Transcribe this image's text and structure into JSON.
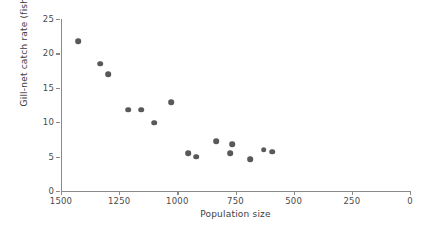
{
  "chart_data": {
    "type": "scatter",
    "title": "",
    "xlabel": "Population size",
    "ylabel": "Gill-net catch rate (fish/net)",
    "xlim": [
      1500,
      0
    ],
    "ylim": [
      0,
      25
    ],
    "x_axis_reversed": true,
    "grid": false,
    "legend": null,
    "xticks": [
      1500,
      1250,
      1000,
      750,
      500,
      250,
      0
    ],
    "xticklabels": [
      "1500",
      "1250",
      "1000",
      "750",
      "500",
      "250",
      "0"
    ],
    "yticks": [
      0,
      5,
      10,
      15,
      20,
      25
    ],
    "yticklabels": [
      "0",
      "5",
      "10",
      "15",
      "20",
      "25"
    ],
    "marker_color": "#58595b",
    "axis_color": "#8a8a8a",
    "points": [
      {
        "x": 1427,
        "y": 21.8
      },
      {
        "x": 1332,
        "y": 18.5
      },
      {
        "x": 1298,
        "y": 17.0
      },
      {
        "x": 1212,
        "y": 11.8
      },
      {
        "x": 1156,
        "y": 11.8
      },
      {
        "x": 1100,
        "y": 9.9
      },
      {
        "x": 1027,
        "y": 12.9
      },
      {
        "x": 954,
        "y": 5.5
      },
      {
        "x": 920,
        "y": 5.0
      },
      {
        "x": 834,
        "y": 7.2
      },
      {
        "x": 774,
        "y": 5.5
      },
      {
        "x": 765,
        "y": 6.8
      },
      {
        "x": 688,
        "y": 4.6
      },
      {
        "x": 628,
        "y": 6.0
      },
      {
        "x": 593,
        "y": 5.7
      }
    ]
  }
}
